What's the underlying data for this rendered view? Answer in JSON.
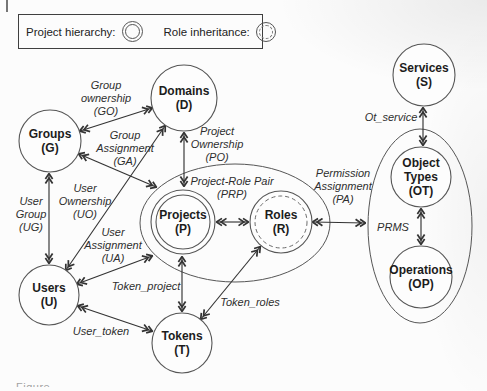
{
  "legend": {
    "project_hierarchy_label": "Project hierarchy:",
    "role_inheritance_label": "Role inheritance:"
  },
  "caption_partial": "Figure",
  "diagram": {
    "stroke_color": "#333333",
    "node_stroke": "#565656",
    "node_fill": "#fdfdfd",
    "containers": [
      {
        "id": "project-role-pair-ellipse",
        "cx": 235,
        "cy": 223,
        "rx": 95,
        "ry": 59
      },
      {
        "id": "prms-ellipse",
        "cx": 420,
        "cy": 226,
        "rx": 52,
        "ry": 97
      }
    ],
    "nodes": [
      {
        "id": "groups",
        "lines": [
          "Groups",
          "(G)"
        ],
        "cx": 50,
        "cy": 141,
        "r": 31,
        "style": "plain"
      },
      {
        "id": "domains",
        "lines": [
          "Domains",
          "(D)"
        ],
        "cx": 184,
        "cy": 98,
        "r": 33,
        "style": "plain"
      },
      {
        "id": "users",
        "lines": [
          "Users",
          "(U)"
        ],
        "cx": 49,
        "cy": 295,
        "r": 30,
        "style": "plain"
      },
      {
        "id": "tokens",
        "lines": [
          "Tokens",
          "(T)"
        ],
        "cx": 182,
        "cy": 343,
        "r": 30,
        "style": "plain"
      },
      {
        "id": "projects",
        "lines": [
          "Projects",
          "(P)"
        ],
        "cx": 183,
        "cy": 222,
        "r": 32,
        "style": "double"
      },
      {
        "id": "roles",
        "lines": [
          "Roles",
          "(R)"
        ],
        "cx": 281,
        "cy": 222,
        "r": 31,
        "style": "dashed-inner"
      },
      {
        "id": "services",
        "lines": [
          "Services",
          "(S)"
        ],
        "cx": 424,
        "cy": 75,
        "r": 31,
        "style": "plain"
      },
      {
        "id": "object-types",
        "lines": [
          "Object",
          "Types",
          "(OT)"
        ],
        "cx": 421,
        "cy": 177,
        "r": 30,
        "style": "plain"
      },
      {
        "id": "operations",
        "lines": [
          "Operations",
          "(OP)"
        ],
        "cx": 421,
        "cy": 277,
        "r": 31,
        "style": "plain"
      }
    ],
    "edges": [
      {
        "id": "group-ownership",
        "x1": 80,
        "y1": 131,
        "x2": 152,
        "y2": 108
      },
      {
        "id": "user-ownership",
        "x1": 66,
        "y1": 270,
        "x2": 165,
        "y2": 126
      },
      {
        "id": "user-group",
        "x1": 49,
        "y1": 174,
        "x2": 49,
        "y2": 263
      },
      {
        "id": "group-assignment",
        "x1": 79,
        "y1": 154,
        "x2": 156,
        "y2": 187
      },
      {
        "id": "project-ownership",
        "x1": 184,
        "y1": 133,
        "x2": 184,
        "y2": 186
      },
      {
        "id": "user-assignment",
        "x1": 77,
        "y1": 284,
        "x2": 152,
        "y2": 256
      },
      {
        "id": "project-role-pair",
        "x1": 217,
        "y1": 222,
        "x2": 248,
        "y2": 222
      },
      {
        "id": "permission-assignment",
        "x1": 313,
        "y1": 222,
        "x2": 365,
        "y2": 223
      },
      {
        "id": "token-project",
        "x1": 182,
        "y1": 257,
        "x2": 182,
        "y2": 311
      },
      {
        "id": "token-roles",
        "x1": 201,
        "y1": 319,
        "x2": 260,
        "y2": 247
      },
      {
        "id": "user-token",
        "x1": 78,
        "y1": 306,
        "x2": 152,
        "y2": 331
      },
      {
        "id": "ot-service",
        "x1": 423,
        "y1": 108,
        "x2": 423,
        "y2": 145
      },
      {
        "id": "ot-op",
        "x1": 421,
        "y1": 209,
        "x2": 421,
        "y2": 244
      }
    ],
    "edge_labels": [
      {
        "id": "group-ownership-label",
        "lines": [
          "Group",
          "ownership",
          "(GO)"
        ],
        "x": 106,
        "y": 98
      },
      {
        "id": "group-assignment-label",
        "lines": [
          "Group",
          "Assignment",
          "(GA)"
        ],
        "x": 125,
        "y": 148
      },
      {
        "id": "project-ownership-label",
        "lines": [
          "Project",
          "Ownership",
          "(PO)"
        ],
        "x": 217,
        "y": 144
      },
      {
        "id": "project-role-pair-label",
        "lines": [
          "Project-Role Pair",
          "(PRP)"
        ],
        "x": 232,
        "y": 187
      },
      {
        "id": "permission-assignment-label",
        "lines": [
          "Permission",
          "Assignment",
          "(PA)"
        ],
        "x": 343,
        "y": 186
      },
      {
        "id": "user-group-label",
        "lines": [
          "User",
          "Group",
          "(UG)"
        ],
        "x": 31,
        "y": 214
      },
      {
        "id": "user-ownership-label",
        "lines": [
          "User",
          "Ownership",
          "(UO)"
        ],
        "x": 85,
        "y": 201
      },
      {
        "id": "user-assignment-label",
        "lines": [
          "User",
          "Assignment",
          "(UA)"
        ],
        "x": 113,
        "y": 245
      },
      {
        "id": "token-project-label",
        "lines": [
          "Token_project"
        ],
        "x": 146,
        "y": 286
      },
      {
        "id": "token-roles-label",
        "lines": [
          "Token_roles"
        ],
        "x": 250,
        "y": 302
      },
      {
        "id": "user-token-label",
        "lines": [
          "User_token"
        ],
        "x": 101,
        "y": 331
      },
      {
        "id": "ot-service-label",
        "lines": [
          "Ot_service"
        ],
        "x": 391,
        "y": 117
      },
      {
        "id": "prms-label",
        "lines": [
          "PRMS"
        ],
        "x": 393,
        "y": 227
      }
    ]
  }
}
